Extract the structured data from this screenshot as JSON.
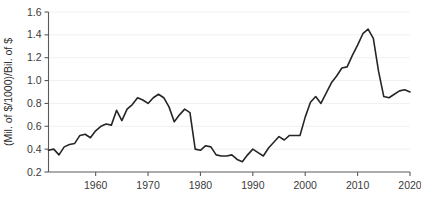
{
  "chart_data": {
    "type": "line",
    "title": "",
    "subtitle": "",
    "xlabel": "",
    "ylabel": "(Mil. of $/1000)/Bil. of $",
    "xlim": [
      1951,
      2020
    ],
    "ylim": [
      0.2,
      1.6
    ],
    "grid": true,
    "legend": false,
    "legend_position": "none",
    "x_ticks": [
      1960,
      1970,
      1980,
      1990,
      2000,
      2010,
      2020
    ],
    "x_tick_labels": [
      "1960",
      "1970",
      "1980",
      "1990",
      "2000",
      "2010",
      "2020"
    ],
    "y_ticks": [
      0.2,
      0.4,
      0.6,
      0.8,
      1.0,
      1.2,
      1.4,
      1.6
    ],
    "y_tick_labels": [
      "0.2",
      "0.4",
      "0.6",
      "0.8",
      "1.0",
      "1.2",
      "1.4",
      "1.6"
    ],
    "line_color": "#262626",
    "grid_color": "#f0f0f0",
    "axis_color": "#5a5a5a",
    "x": [
      1951,
      1952,
      1953,
      1954,
      1955,
      1956,
      1957,
      1958,
      1959,
      1960,
      1961,
      1962,
      1963,
      1964,
      1965,
      1966,
      1967,
      1968,
      1969,
      1970,
      1971,
      1972,
      1973,
      1974,
      1975,
      1976,
      1977,
      1978,
      1979,
      1980,
      1981,
      1982,
      1983,
      1984,
      1985,
      1986,
      1987,
      1988,
      1989,
      1990,
      1991,
      1992,
      1993,
      1994,
      1995,
      1996,
      1997,
      1998,
      1999,
      2000,
      2001,
      2002,
      2003,
      2004,
      2005,
      2006,
      2007,
      2008,
      2009,
      2010,
      2011,
      2012,
      2013,
      2014,
      2015,
      2016,
      2017,
      2018,
      2019,
      2020
    ],
    "series": [
      {
        "name": "ratio",
        "values": [
          0.39,
          0.4,
          0.35,
          0.42,
          0.44,
          0.45,
          0.52,
          0.53,
          0.5,
          0.56,
          0.6,
          0.62,
          0.61,
          0.74,
          0.65,
          0.75,
          0.79,
          0.85,
          0.83,
          0.8,
          0.85,
          0.88,
          0.85,
          0.77,
          0.64,
          0.7,
          0.75,
          0.72,
          0.4,
          0.39,
          0.43,
          0.42,
          0.35,
          0.34,
          0.34,
          0.35,
          0.31,
          0.29,
          0.35,
          0.4,
          0.37,
          0.34,
          0.41,
          0.46,
          0.51,
          0.48,
          0.52,
          0.52,
          0.52,
          0.68,
          0.81,
          0.86,
          0.8,
          0.89,
          0.98,
          1.04,
          1.11,
          1.12,
          1.22,
          1.31,
          1.41,
          1.45,
          1.37,
          1.08,
          0.86,
          0.85,
          0.88,
          0.91,
          0.92,
          0.9
        ]
      }
    ],
    "series_full_x": [
      1951,
      1952,
      1953,
      1954,
      1955,
      1956,
      1957,
      1958,
      1959,
      1960,
      1961,
      1962,
      1963,
      1964,
      1965,
      1966,
      1967,
      1968,
      1969,
      1970,
      1971,
      1972,
      1973,
      1974,
      1975,
      1976,
      1977,
      1978,
      1979,
      1980,
      1981,
      1982,
      1983,
      1984,
      1985,
      1986,
      1987,
      1988,
      1989,
      1990,
      1991,
      1992,
      1993,
      1994,
      1995,
      1996,
      1997,
      1998,
      1999,
      2000,
      2001,
      2002,
      2003,
      2004,
      2005,
      2006,
      2007,
      2008,
      2009,
      2010,
      2011,
      2012,
      2013,
      2014,
      2015,
      2016,
      2017,
      2018,
      2019,
      2020
    ],
    "series_full_y": [
      0.39,
      0.4,
      0.35,
      0.42,
      0.44,
      0.45,
      0.52,
      0.53,
      0.5,
      0.56,
      0.6,
      0.62,
      0.61,
      0.74,
      0.65,
      0.75,
      0.79,
      0.85,
      0.83,
      0.8,
      0.85,
      0.88,
      0.85,
      0.77,
      0.64,
      0.7,
      0.75,
      0.72,
      0.4,
      0.39,
      0.43,
      0.42,
      0.35,
      0.34,
      0.34,
      0.35,
      0.31,
      0.29,
      0.35,
      0.4,
      0.37,
      0.34,
      0.41,
      0.46,
      0.51,
      0.48,
      0.52,
      0.52,
      0.52,
      0.68,
      0.81,
      0.86,
      0.8,
      0.89,
      0.98,
      1.04,
      1.11,
      1.12,
      1.22,
      1.31,
      1.41,
      1.45,
      1.37,
      1.08,
      0.86,
      0.85,
      0.88,
      0.91,
      0.92,
      0.9
    ],
    "annotations": [],
    "notes": {
      "peak_year": "2000",
      "peak_value": "1.45",
      "min_year": "1982",
      "min_value": "0.29"
    }
  }
}
